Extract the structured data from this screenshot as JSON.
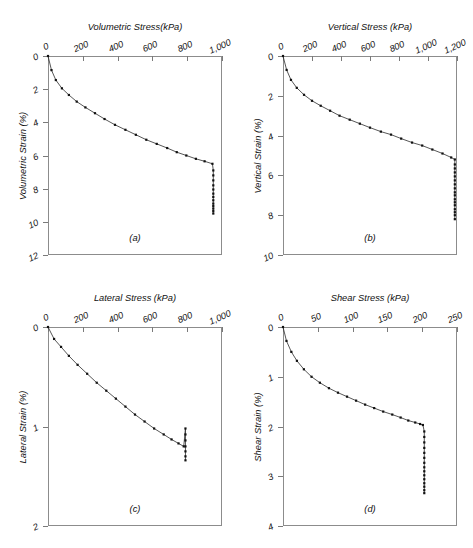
{
  "figure": {
    "background": "#ffffff",
    "line_color": "#2b2b2b",
    "marker_color": "#111111",
    "axis_color": "#8c8c8c"
  },
  "chart_data": [
    {
      "type": "line",
      "panel": "(a)",
      "title": "Volumetric Stress(kPa)",
      "xlabel": "Volumetric Stress(kPa)",
      "ylabel": "Volumetric Strain (%)",
      "xlim": [
        0,
        1000
      ],
      "ylim": [
        0,
        12
      ],
      "y_inverted": true,
      "xticks": [
        0,
        200,
        400,
        600,
        800,
        1000
      ],
      "xticklabels": [
        "0",
        "200",
        "400",
        "600",
        "800",
        "1,000"
      ],
      "yticks": [
        0,
        2,
        4,
        6,
        8,
        10,
        12
      ],
      "yticklabels": [
        "0",
        "2",
        "4",
        "6",
        "8",
        "10",
        "12"
      ],
      "grid": false,
      "legend": null,
      "series": [
        {
          "name": "loading-curve",
          "x": [
            0,
            20,
            45,
            80,
            120,
            165,
            215,
            270,
            325,
            385,
            445,
            505,
            565,
            625,
            685,
            740,
            795,
            850,
            900,
            945
          ],
          "y": [
            0.0,
            0.85,
            1.45,
            1.95,
            2.35,
            2.75,
            3.1,
            3.45,
            3.8,
            4.15,
            4.45,
            4.75,
            5.05,
            5.3,
            5.55,
            5.8,
            6.0,
            6.2,
            6.35,
            6.5
          ]
        },
        {
          "name": "creep-tail",
          "x": [
            950,
            950,
            950,
            950,
            950,
            950,
            950,
            950,
            950,
            950,
            950,
            950,
            950
          ],
          "y": [
            6.9,
            7.2,
            7.5,
            7.8,
            8.05,
            8.3,
            8.5,
            8.7,
            8.9,
            9.05,
            9.2,
            9.35,
            9.5
          ]
        }
      ]
    },
    {
      "type": "line",
      "panel": "(b)",
      "title": "Vertical Stress (kPa)",
      "xlabel": "Vertical Stress (kPa)",
      "ylabel": "Vertical Strain (%)",
      "xlim": [
        0,
        1200
      ],
      "ylim": [
        0,
        10
      ],
      "y_inverted": true,
      "xticks": [
        0,
        200,
        400,
        600,
        800,
        1000,
        1200
      ],
      "xticklabels": [
        "0",
        "200",
        "400",
        "600",
        "800",
        "1,000",
        "1,200"
      ],
      "yticks": [
        0,
        2,
        4,
        6,
        8,
        10
      ],
      "yticklabels": [
        "0",
        "2",
        "4",
        "6",
        "8",
        "10"
      ],
      "grid": false,
      "legend": null,
      "series": [
        {
          "name": "loading-curve",
          "x": [
            0,
            25,
            55,
            95,
            145,
            200,
            260,
            325,
            390,
            460,
            530,
            600,
            675,
            745,
            815,
            890,
            960,
            1030,
            1100,
            1160,
            1185
          ],
          "y": [
            0.0,
            0.7,
            1.2,
            1.6,
            1.95,
            2.25,
            2.5,
            2.75,
            3.0,
            3.2,
            3.4,
            3.6,
            3.8,
            3.95,
            4.15,
            4.35,
            4.5,
            4.7,
            4.9,
            5.1,
            5.2
          ]
        },
        {
          "name": "creep-tail",
          "x": [
            1185,
            1185,
            1185,
            1185,
            1185,
            1185,
            1185,
            1185,
            1185,
            1185,
            1185,
            1185,
            1185,
            1185,
            1185,
            1185
          ],
          "y": [
            5.45,
            5.65,
            5.85,
            6.05,
            6.25,
            6.45,
            6.65,
            6.85,
            7.0,
            7.2,
            7.35,
            7.5,
            7.7,
            7.85,
            8.0,
            8.2
          ]
        }
      ]
    },
    {
      "type": "line",
      "panel": "(c)",
      "title": "Lateral Stress (kPa)",
      "xlabel": "Lateral Stress (kPa)",
      "ylabel": "Lateral Strain (%)",
      "xlim": [
        0,
        1000
      ],
      "ylim": [
        0,
        2
      ],
      "y_inverted": true,
      "xticks": [
        0,
        200,
        400,
        600,
        800,
        1000
      ],
      "xticklabels": [
        "0",
        "200",
        "400",
        "600",
        "800",
        "1,000"
      ],
      "yticks": [
        0,
        1,
        2
      ],
      "yticklabels": [
        "0",
        "1",
        "2"
      ],
      "grid": false,
      "legend": null,
      "series": [
        {
          "name": "loading-curve",
          "x": [
            0,
            35,
            75,
            120,
            170,
            225,
            280,
            335,
            390,
            445,
            500,
            555,
            610,
            665,
            710,
            750,
            780
          ],
          "y": [
            0.0,
            0.12,
            0.2,
            0.29,
            0.38,
            0.47,
            0.56,
            0.64,
            0.72,
            0.8,
            0.88,
            0.95,
            1.02,
            1.08,
            1.13,
            1.17,
            1.2
          ]
        },
        {
          "name": "creep-tail",
          "x": [
            790,
            790,
            790,
            790,
            790,
            790,
            790
          ],
          "y": [
            1.02,
            1.08,
            1.14,
            1.2,
            1.25,
            1.3,
            1.34
          ]
        }
      ]
    },
    {
      "type": "line",
      "panel": "(d)",
      "title": "Shear Stress (kPa)",
      "xlabel": "Shear Stress (kPa)",
      "ylabel": "Shear Strain (%)",
      "xlim": [
        0,
        250
      ],
      "ylim": [
        0,
        4
      ],
      "y_inverted": true,
      "xticks": [
        0,
        50,
        100,
        150,
        200,
        250
      ],
      "xticklabels": [
        "0",
        "50",
        "100",
        "150",
        "200",
        "250"
      ],
      "yticks": [
        0,
        1,
        2,
        3,
        4
      ],
      "yticklabels": [
        "0",
        "1",
        "2",
        "3",
        "4"
      ],
      "grid": false,
      "legend": null,
      "series": [
        {
          "name": "loading-curve",
          "x": [
            0,
            5,
            12,
            20,
            30,
            41,
            53,
            66,
            79,
            92,
            105,
            118,
            131,
            144,
            157,
            169,
            180,
            190,
            197,
            201
          ],
          "y": [
            0.0,
            0.28,
            0.5,
            0.68,
            0.85,
            1.0,
            1.12,
            1.23,
            1.32,
            1.4,
            1.48,
            1.56,
            1.63,
            1.7,
            1.76,
            1.82,
            1.88,
            1.92,
            1.95,
            1.97
          ]
        },
        {
          "name": "creep-tail",
          "x": [
            203,
            203,
            203,
            203,
            203,
            203,
            203,
            203,
            203,
            203,
            203,
            203,
            203,
            203,
            203
          ],
          "y": [
            2.1,
            2.21,
            2.32,
            2.43,
            2.53,
            2.63,
            2.73,
            2.82,
            2.9,
            2.98,
            3.06,
            3.14,
            3.21,
            3.28,
            3.34
          ]
        }
      ]
    }
  ]
}
